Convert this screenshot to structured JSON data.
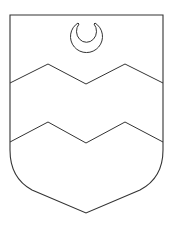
{
  "figure": {
    "charges": [
      "crescent",
      "dancetty-line-upper",
      "dancetty-line-lower"
    ],
    "colors": {
      "line": "#333333",
      "field": "#ffffff"
    }
  }
}
